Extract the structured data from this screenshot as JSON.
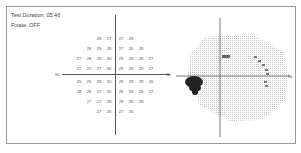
{
  "header": {
    "test_duration": "Test Duration: 05:46",
    "fixation": "Fixate: OFF"
  },
  "numeric_plot": {
    "x_axis_label_left": "90",
    "x_axis_label_right": "90",
    "rows": [
      [
        "26",
        "27",
        "27",
        "26"
      ],
      [
        "28",
        "29",
        "28",
        "27",
        "26",
        "28"
      ],
      [
        "27",
        "28",
        "29",
        "30",
        "29",
        "28",
        "28",
        "27"
      ],
      [
        "27",
        "27",
        "27",
        "30",
        "29",
        "28",
        "29",
        "27"
      ],
      [
        "25",
        "25",
        "28",
        "30",
        "29",
        "29",
        "29",
        "26"
      ],
      [
        "28",
        "28",
        "27",
        "30",
        "28",
        "28",
        "28",
        "27"
      ],
      [
        "27",
        "27",
        "28",
        "29",
        "28",
        "28"
      ],
      [
        "27",
        "26",
        "27",
        "26"
      ]
    ]
  },
  "scatter_plot": {
    "type": "visual-field-map",
    "blind_spot_label": "blind spot cluster",
    "axis_label_right": "90"
  },
  "colors": {
    "frame_border": "#9a9a9a",
    "axis": "#555555",
    "grid_dots": "#c8c8c8",
    "blind_spot": "#222222"
  }
}
